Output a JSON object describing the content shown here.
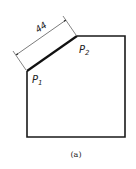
{
  "figure": {
    "caption": "(a)",
    "dimension_label": "44",
    "points": {
      "p1": {
        "label_main": "P",
        "label_sub": "1"
      },
      "p2": {
        "label_main": "P",
        "label_sub": "2"
      }
    },
    "colors": {
      "stroke": "#1a1a1a",
      "thin": "#333333",
      "background": "#ffffff"
    }
  }
}
